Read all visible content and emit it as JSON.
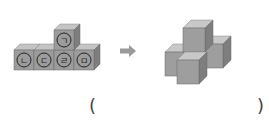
{
  "left_figure": {
    "description": "Five cubes: four in a row with one stacked on top of the third",
    "labels": {
      "top": "ㄱ",
      "row": [
        "ㄴ",
        "ㄷ",
        "ㄹ",
        "ㅁ"
      ]
    }
  },
  "arrow": {
    "icon": "right-arrow-icon",
    "color": "#9a9a9a"
  },
  "right_figure": {
    "description": "Five cubes arranged in a 3D cross shape (one on top, four around)"
  },
  "answer": {
    "open_paren": "(",
    "close_paren": ")",
    "value": ""
  },
  "colors": {
    "cube_front": "#9c9c9c",
    "cube_top": "#c4c4c4",
    "cube_side": "#7e7e7e",
    "edge": "#6a6a6a",
    "label_ring": "#222222"
  }
}
